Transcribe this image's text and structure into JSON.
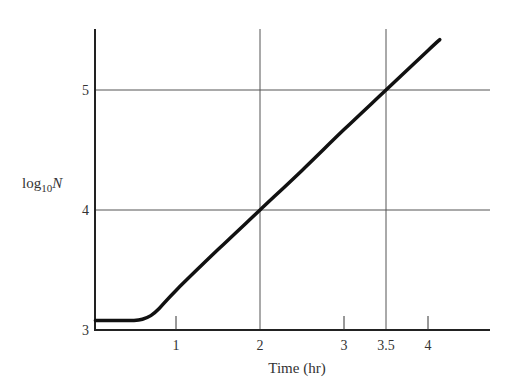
{
  "chart_data": {
    "type": "line",
    "title": "",
    "xlabel": "Time (hr)",
    "ylabel": "log10N",
    "ylabel_parts": {
      "base": "log",
      "sub": "10",
      "var": "N"
    },
    "xlim": [
      0,
      4.7
    ],
    "ylim": [
      3,
      5.45
    ],
    "grid": "partial (x=2, x=3.5, y=4, y=5)",
    "x_ticks": [
      {
        "value": 1,
        "label": "1",
        "gridline": false
      },
      {
        "value": 2,
        "label": "2",
        "gridline": true
      },
      {
        "value": 3,
        "label": "3",
        "gridline": false
      },
      {
        "value": 3.5,
        "label": "3.5",
        "gridline": true
      },
      {
        "value": 4,
        "label": "4",
        "gridline": false
      }
    ],
    "y_ticks": [
      {
        "value": 3,
        "label": "3",
        "gridline": false
      },
      {
        "value": 4,
        "label": "4",
        "gridline": true
      },
      {
        "value": 5,
        "label": "5",
        "gridline": true
      }
    ],
    "series": [
      {
        "name": "growth curve",
        "x": [
          0.04,
          0.3,
          0.5,
          0.6,
          0.7,
          0.8,
          1.0,
          1.5,
          2.0,
          2.5,
          3.0,
          3.5,
          4.0,
          4.14
        ],
        "y": [
          3.08,
          3.08,
          3.08,
          3.09,
          3.12,
          3.18,
          3.33,
          3.67,
          4.0,
          4.33,
          4.67,
          5.0,
          5.33,
          5.42
        ]
      }
    ],
    "annotations": [
      "lag phase ≈ 0–0.7 hr at log10N ≈ 3.08",
      "exponential slope ≈ 0.67 log10 units/hr (1 log per 1.5 hr)"
    ],
    "legend": null
  }
}
